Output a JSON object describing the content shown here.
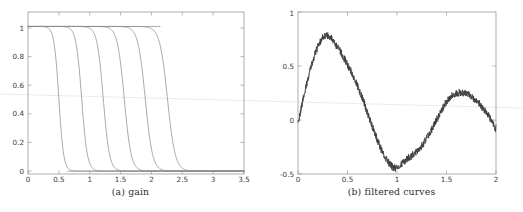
{
  "figure": {
    "width": 523,
    "height": 212,
    "background": "#ffffff"
  },
  "panels": [
    {
      "id": "panel-a",
      "caption": "(a) gain",
      "box": {
        "left": 28,
        "top": 12,
        "right": 244,
        "bottom": 174
      },
      "chart_data": {
        "type": "line",
        "title": "(a) gain",
        "xlabel": "",
        "ylabel": "",
        "xlim": [
          0,
          3.5
        ],
        "ylim": [
          -0.02,
          1.1
        ],
        "grid": false,
        "legend": "none",
        "xticks": [
          0,
          0.5,
          1,
          1.5,
          2,
          2.5,
          3,
          3.5
        ],
        "xticklabels": [
          "0",
          "0.5",
          "1",
          "1.5",
          "2",
          "2.5",
          "3",
          "3.5"
        ],
        "yticks": [
          0,
          0.2,
          0.4,
          0.6,
          0.8,
          1
        ],
        "yticklabels": [
          "0",
          "0.2",
          "0.4",
          "0.6",
          "0.8",
          "1"
        ],
        "description": "Six sigmoid gain roll-off curves, each dropping from 1 to 0 at successively larger cutoff frequencies.",
        "series": [
          {
            "name": "gain-1",
            "cutoff": 0.5,
            "steepness": 26,
            "color": "#8d8d8d"
          },
          {
            "name": "gain-2",
            "cutoff": 0.87,
            "steepness": 22,
            "color": "#8d8d8d"
          },
          {
            "name": "gain-3",
            "cutoff": 1.22,
            "steepness": 20,
            "color": "#8d8d8d"
          },
          {
            "name": "gain-4",
            "cutoff": 1.56,
            "steepness": 18,
            "color": "#8d8d8d"
          },
          {
            "name": "gain-5",
            "cutoff": 1.9,
            "steepness": 17,
            "color": "#8d8d8d"
          },
          {
            "name": "gain-6",
            "cutoff": 2.26,
            "steepness": 16,
            "color": "#8d8d8d"
          }
        ]
      }
    },
    {
      "id": "panel-b",
      "caption": "(b) filtered curves",
      "box": {
        "left": 37,
        "top": 12,
        "right": 235,
        "bottom": 174
      },
      "chart_data": {
        "type": "line",
        "title": "(b) filtered curves",
        "xlabel": "",
        "ylabel": "",
        "xlim": [
          0,
          2
        ],
        "ylim": [
          -0.5,
          1
        ],
        "grid": false,
        "legend": "none",
        "xticks": [
          0,
          0.5,
          1,
          1.5,
          2
        ],
        "xticklabels": [
          "0",
          "0.5",
          "1",
          "1.5",
          "2"
        ],
        "yticks": [
          -0.5,
          0,
          0.5,
          1
        ],
        "yticklabels": [
          "-0.5",
          "0",
          "0.5",
          "1"
        ],
        "description": "A noisy bimodal filtered signal: rises from 0 to a peak of about 0.78 near x = 0.3, falls to a trough of about -0.44 near x = 0.95, rises to a secondary peak of about 0.25 near x = 1.6, then decays to about -0.08 at x = 2.",
        "x": [
          0.0,
          0.05,
          0.1,
          0.15,
          0.2,
          0.25,
          0.3,
          0.35,
          0.4,
          0.45,
          0.5,
          0.55,
          0.6,
          0.65,
          0.7,
          0.75,
          0.8,
          0.85,
          0.9,
          0.95,
          1.0,
          1.05,
          1.1,
          1.15,
          1.2,
          1.25,
          1.3,
          1.35,
          1.4,
          1.45,
          1.5,
          1.55,
          1.6,
          1.65,
          1.7,
          1.75,
          1.8,
          1.85,
          1.9,
          1.95,
          2.0
        ],
        "y": [
          -0.02,
          0.18,
          0.38,
          0.55,
          0.68,
          0.76,
          0.78,
          0.74,
          0.67,
          0.6,
          0.51,
          0.42,
          0.32,
          0.2,
          0.07,
          -0.06,
          -0.18,
          -0.29,
          -0.37,
          -0.43,
          -0.44,
          -0.4,
          -0.36,
          -0.33,
          -0.29,
          -0.24,
          -0.17,
          -0.09,
          0.0,
          0.09,
          0.17,
          0.22,
          0.25,
          0.25,
          0.24,
          0.22,
          0.18,
          0.13,
          0.07,
          0.0,
          -0.08
        ],
        "noise_amplitude": 0.035,
        "color": "#3d3d3d"
      }
    }
  ]
}
